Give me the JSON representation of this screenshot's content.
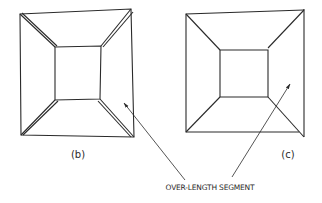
{
  "figures": [
    {
      "id": "b",
      "caption": "(b)"
    },
    {
      "id": "c",
      "caption": "(c)"
    }
  ],
  "annotation": {
    "text": "OVER-LENGTH SEGMENT"
  },
  "colors": {
    "line": "#2a2a2a",
    "background": "#ffffff"
  }
}
